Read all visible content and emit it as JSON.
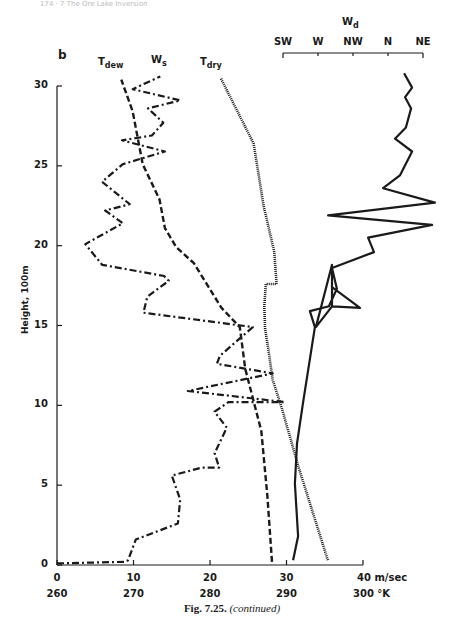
{
  "page_header": "174 · 7 The Ore Lake Inversion",
  "panel_letter": "b",
  "caption": {
    "fig": "Fig. 7.25.",
    "note": "(continued)"
  },
  "chart_data": {
    "type": "line",
    "title": "",
    "panel": "b",
    "ylabel": "Height, 100m",
    "ylim": [
      0,
      30
    ],
    "yticks": [
      0,
      5,
      10,
      15,
      20,
      25,
      30
    ],
    "x_axes": [
      {
        "name": "wind speed",
        "unit": "m/sec",
        "ticks": [
          0,
          10,
          20,
          30,
          40
        ],
        "tick_labels": [
          "0",
          "10",
          "20",
          "30",
          "40 m/sec"
        ],
        "range": [
          0,
          40
        ]
      },
      {
        "name": "temperature",
        "unit": "°K",
        "ticks": [
          260,
          270,
          280,
          290,
          300
        ],
        "tick_labels": [
          "260",
          "270",
          "280",
          "290",
          "300 °K"
        ],
        "range": [
          260,
          300
        ]
      },
      {
        "name": "wind direction",
        "label": "Wd",
        "position": "top",
        "tick_labels": [
          "SW",
          "W",
          "NW",
          "N",
          "NE"
        ],
        "range": [
          0,
          4
        ]
      }
    ],
    "legend_position": "inline labels at top of curves",
    "grid": false,
    "series": [
      {
        "name": "Tdew",
        "label_main": "T",
        "label_sub": "dew",
        "axis": "temperature",
        "style": "dashed",
        "points": [
          [
            288.1,
            0.2
          ],
          [
            287.5,
            4.3
          ],
          [
            286.7,
            8.4
          ],
          [
            284.6,
            12.3
          ],
          [
            283.9,
            14.9
          ],
          [
            281.5,
            16.1
          ],
          [
            277.9,
            18.9
          ],
          [
            275.6,
            19.9
          ],
          [
            274.1,
            21.1
          ],
          [
            273.4,
            22.9
          ],
          [
            271.2,
            25.1
          ],
          [
            269.9,
            28.4
          ],
          [
            268.4,
            30.4
          ]
        ]
      },
      {
        "name": "Ws",
        "label_main": "W",
        "label_sub": "s",
        "axis": "wind speed",
        "style": "dash-dot",
        "points": [
          [
            0,
            0.1
          ],
          [
            8.9,
            0.2
          ],
          [
            9.3,
            0.3
          ],
          [
            9.3,
            0.3
          ],
          [
            10.3,
            1.6
          ],
          [
            15.8,
            2.6
          ],
          [
            16.1,
            4.1
          ],
          [
            15.0,
            5.6
          ],
          [
            18.9,
            6.1
          ],
          [
            21.2,
            6.1
          ],
          [
            20.6,
            7.0
          ],
          [
            22.2,
            8.6
          ],
          [
            20.6,
            9.6
          ],
          [
            22.4,
            10.2
          ],
          [
            29.8,
            10.2
          ],
          [
            17.1,
            10.9
          ],
          [
            28.2,
            12.0
          ],
          [
            20.9,
            12.6
          ],
          [
            21.3,
            13.1
          ],
          [
            25.6,
            14.9
          ],
          [
            11.3,
            15.8
          ],
          [
            11.3,
            15.8
          ],
          [
            11.8,
            16.8
          ],
          [
            14.6,
            17.8
          ],
          [
            14.0,
            18.1
          ],
          [
            5.9,
            18.8
          ],
          [
            3.7,
            20.1
          ],
          [
            8.6,
            21.4
          ],
          [
            6.3,
            22.2
          ],
          [
            9.5,
            22.6
          ],
          [
            5.9,
            24.0
          ],
          [
            8.6,
            25.1
          ],
          [
            14.1,
            25.9
          ],
          [
            8.5,
            26.6
          ],
          [
            12.4,
            26.9
          ],
          [
            13.9,
            27.7
          ],
          [
            11.9,
            28.6
          ],
          [
            16.1,
            29.1
          ],
          [
            9.9,
            29.8
          ],
          [
            13.5,
            30.6
          ]
        ]
      },
      {
        "name": "Tdry",
        "label_main": "T",
        "label_sub": "dry",
        "axis": "temperature",
        "style": "dotted",
        "points": [
          [
            295.4,
            0.3
          ],
          [
            291.6,
            6.1
          ],
          [
            289.4,
            9.8
          ],
          [
            288.2,
            11.6
          ],
          [
            287.6,
            13.6
          ],
          [
            287.2,
            14.8
          ],
          [
            287.1,
            16.2
          ],
          [
            287.3,
            17.6
          ],
          [
            288.7,
            17.6
          ],
          [
            288.4,
            19.6
          ],
          [
            287.0,
            22.5
          ],
          [
            285.7,
            26.4
          ],
          [
            281.4,
            30.5
          ]
        ]
      },
      {
        "name": "Wd",
        "label_main": "W",
        "label_sub": "d",
        "axis": "wind direction",
        "style": "solid",
        "points": [
          [
            0.29,
            0.3
          ],
          [
            0.43,
            1.8
          ],
          [
            0.34,
            5.1
          ],
          [
            0.4,
            7.6
          ],
          [
            0.57,
            10.1
          ],
          [
            0.91,
            14.9
          ],
          [
            0.77,
            15.9
          ],
          [
            1.31,
            16.2
          ],
          [
            1.54,
            17.3
          ],
          [
            1.4,
            18.6
          ],
          [
            1.4,
            16.9
          ],
          [
            1.4,
            16.2
          ],
          [
            1.4,
            18.8
          ],
          [
            0.94,
            14.9
          ],
          [
            1.4,
            16.2
          ],
          [
            2.2,
            16.1
          ],
          [
            1.4,
            17.4
          ],
          [
            1.4,
            18.6
          ],
          [
            2.6,
            19.6
          ],
          [
            2.43,
            20.5
          ],
          [
            4.26,
            21.3
          ],
          [
            1.29,
            21.9
          ],
          [
            4.34,
            22.7
          ],
          [
            2.86,
            23.6
          ],
          [
            3.34,
            24.4
          ],
          [
            3.69,
            25.9
          ],
          [
            3.2,
            26.7
          ],
          [
            3.51,
            27.4
          ],
          [
            3.66,
            28.6
          ],
          [
            3.49,
            29.3
          ],
          [
            3.69,
            29.9
          ],
          [
            3.46,
            30.8
          ]
        ]
      }
    ]
  }
}
